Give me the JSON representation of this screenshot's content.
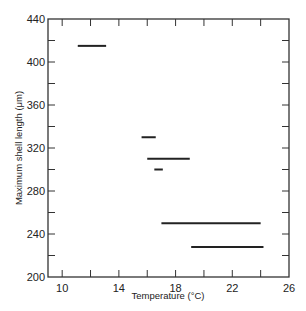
{
  "chart_data": {
    "type": "range-segments",
    "title": "",
    "xlabel": "Temperature (°C)",
    "ylabel": "Maximum shell length (μm)",
    "xlim": [
      9,
      26
    ],
    "ylim": [
      200,
      440
    ],
    "xticks": [
      10,
      14,
      18,
      22,
      26
    ],
    "xminor_ticks": [
      12,
      16,
      20,
      24
    ],
    "yticks": [
      200,
      240,
      280,
      320,
      360,
      400,
      440
    ],
    "yminor_ticks": [
      220,
      260,
      300,
      340,
      380,
      420
    ],
    "grid": false,
    "legend": null,
    "segments": [
      {
        "y": 415,
        "x_start": 11.1,
        "x_end": 13.1
      },
      {
        "y": 330,
        "x_start": 15.6,
        "x_end": 16.6
      },
      {
        "y": 310,
        "x_start": 16.0,
        "x_end": 19.0
      },
      {
        "y": 300,
        "x_start": 16.5,
        "x_end": 17.1
      },
      {
        "y": 250,
        "x_start": 17.0,
        "x_end": 24.0
      },
      {
        "y": 228,
        "x_start": 19.1,
        "x_end": 24.2
      }
    ]
  },
  "labels": {
    "xlabel": "Temperature (°C)",
    "ylabel": "Maximum shell length (μm)"
  }
}
